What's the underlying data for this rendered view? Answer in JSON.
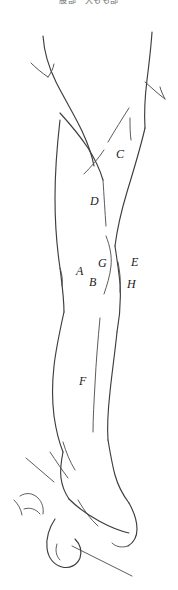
{
  "figure": {
    "title_strip": "股部　大もも部",
    "background_color": "#ffffff",
    "line_color": "#3d3d3d",
    "width": 178,
    "height": 590
  },
  "labels": [
    {
      "id": "label-c",
      "text": "C",
      "x": 116,
      "y": 148
    },
    {
      "id": "label-d",
      "text": "D",
      "x": 90,
      "y": 195
    },
    {
      "id": "label-a",
      "text": "A",
      "x": 76,
      "y": 265
    },
    {
      "id": "label-g",
      "text": "G",
      "x": 98,
      "y": 257
    },
    {
      "id": "label-b",
      "text": "B",
      "x": 89,
      "y": 276
    },
    {
      "id": "label-e",
      "text": "E",
      "x": 131,
      "y": 256
    },
    {
      "id": "label-h",
      "text": "H",
      "x": 127,
      "y": 278
    },
    {
      "id": "label-f",
      "text": "F",
      "x": 79,
      "y": 375
    }
  ]
}
